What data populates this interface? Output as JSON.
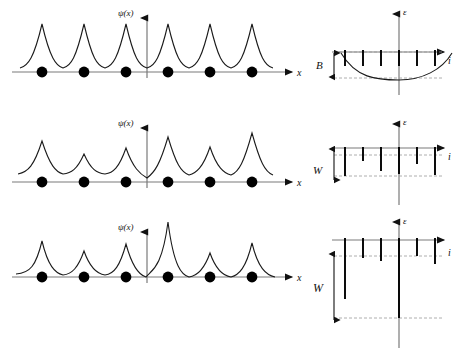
{
  "figure": {
    "title": "",
    "rows": [
      {
        "id": "row-extended",
        "left": {
          "y_axis_label": "ψ(x)",
          "x_axis_label": "x",
          "n_sites": 6,
          "peak_heights": [
            1.0,
            1.0,
            1.0,
            1.0,
            1.0,
            1.0
          ],
          "peak_widths": [
            1.0,
            1.0,
            1.0,
            1.0,
            1.0,
            1.0
          ],
          "description": "extended-uniform-wavefunction"
        },
        "right": {
          "y_axis_label": "ε",
          "x_axis_label": "i",
          "bracket_label": "B",
          "n_levels": 6,
          "level_depths": [
            0.3,
            0.3,
            0.3,
            0.3,
            0.3,
            0.3
          ],
          "band_curve": true,
          "description": "narrow-band-with-cosine-dispersion"
        }
      },
      {
        "id": "row-weak-disorder",
        "left": {
          "y_axis_label": "ψ(x)",
          "x_axis_label": "x",
          "n_sites": 6,
          "peak_heights": [
            0.78,
            0.5,
            0.6,
            0.88,
            0.62,
            0.95
          ],
          "peak_widths": [
            0.85,
            0.95,
            0.9,
            0.8,
            0.85,
            0.78
          ],
          "description": "weakly-disordered-wavefunction"
        },
        "right": {
          "y_axis_label": "ε",
          "x_axis_label": "i",
          "bracket_label": "W",
          "n_levels": 6,
          "level_depths": [
            0.95,
            0.45,
            0.8,
            0.9,
            0.55,
            0.92
          ],
          "band_curve": false,
          "description": "levels-scattered-within-width-W"
        }
      },
      {
        "id": "row-strong-disorder",
        "left": {
          "y_axis_label": "ψ(x)",
          "x_axis_label": "x",
          "n_sites": 6,
          "peak_heights": [
            0.62,
            0.48,
            0.66,
            1.45,
            0.52,
            0.7
          ],
          "peak_widths": [
            0.55,
            0.62,
            0.58,
            0.3,
            0.55,
            0.55
          ],
          "description": "strongly-localized-wavefunction"
        },
        "right": {
          "y_axis_label": "ε",
          "x_axis_label": "i",
          "bracket_label": "W",
          "n_levels": 6,
          "level_depths": [
            0.72,
            0.2,
            0.22,
            1.0,
            0.18,
            0.26
          ],
          "band_curve": false,
          "description": "levels-scattered-over-large-width-W"
        }
      }
    ],
    "colors": {
      "curve": "#1a1a1a",
      "axis": "#7a7a7a",
      "dot": "#000000",
      "level": "#000000",
      "dashed": "#999999"
    }
  }
}
